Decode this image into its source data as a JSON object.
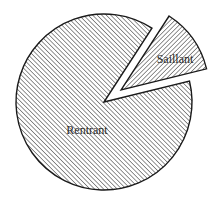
{
  "chart_data": {
    "type": "pie",
    "title": "",
    "slices": [
      {
        "label": "Rentrant",
        "value": 88,
        "exploded": false,
        "hatch": "forward-diagonal"
      },
      {
        "label": "Saillant",
        "value": 12,
        "exploded": true,
        "hatch": "backward-diagonal"
      }
    ],
    "start_angle_deg": -57,
    "legend": "none",
    "colors": {
      "stroke": "#1a1a1a",
      "hatch": "#3a3a3a",
      "background": "#ffffff",
      "text": "#2a2a2a"
    }
  }
}
